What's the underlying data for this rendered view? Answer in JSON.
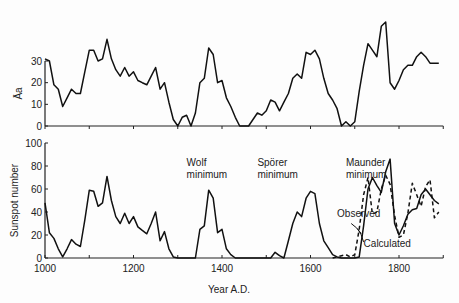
{
  "chart_data": [
    {
      "type": "line",
      "panel": "top",
      "ylabel": "Āa",
      "xlabel": "",
      "ylim": [
        0,
        40
      ],
      "yticks": [
        0,
        10,
        20,
        30
      ],
      "xlim": [
        1000,
        1900
      ],
      "grid": false,
      "series": [
        {
          "name": "Aa",
          "style": "solid",
          "x": [
            1000,
            1010,
            1020,
            1030,
            1040,
            1050,
            1060,
            1070,
            1080,
            1090,
            1100,
            1110,
            1120,
            1130,
            1140,
            1150,
            1160,
            1170,
            1180,
            1190,
            1200,
            1210,
            1220,
            1230,
            1240,
            1250,
            1260,
            1270,
            1280,
            1290,
            1300,
            1310,
            1320,
            1330,
            1340,
            1350,
            1360,
            1370,
            1380,
            1390,
            1400,
            1410,
            1420,
            1430,
            1440,
            1450,
            1460,
            1470,
            1480,
            1490,
            1500,
            1510,
            1520,
            1530,
            1540,
            1550,
            1560,
            1570,
            1580,
            1590,
            1600,
            1610,
            1620,
            1630,
            1640,
            1650,
            1660,
            1670,
            1680,
            1690,
            1700,
            1710,
            1720,
            1730,
            1740,
            1750,
            1760,
            1770,
            1780,
            1790,
            1800,
            1810,
            1820,
            1830,
            1840,
            1850,
            1860,
            1870,
            1880,
            1890
          ],
          "values": [
            31,
            30,
            19,
            17,
            9,
            13,
            17,
            15,
            15,
            25,
            35,
            35,
            30,
            31,
            40,
            31,
            26,
            23,
            27,
            23,
            25,
            21,
            20,
            19,
            23,
            27,
            17,
            20,
            11,
            3,
            0,
            4,
            5,
            0,
            6,
            20,
            22,
            36,
            33,
            20,
            21,
            13,
            9,
            4,
            0,
            0,
            0,
            3,
            6,
            5,
            7,
            12,
            11,
            7,
            11,
            15,
            22,
            24,
            22,
            34,
            33,
            35,
            31,
            22,
            15,
            12,
            8,
            0,
            2,
            0,
            2,
            16,
            28,
            38,
            35,
            32,
            46,
            48,
            20,
            17,
            21,
            26,
            28,
            28,
            32,
            34,
            32,
            29,
            29,
            29
          ]
        }
      ]
    },
    {
      "type": "line",
      "panel": "bottom",
      "ylabel": "Sunspot number",
      "xlabel": "Year A.D.",
      "ylim": [
        0,
        100
      ],
      "yticks": [
        0,
        20,
        40,
        60,
        80,
        100
      ],
      "xlim": [
        1000,
        1900
      ],
      "xticks": [
        1000,
        1200,
        1400,
        1600,
        1800
      ],
      "grid": false,
      "annotations": [
        {
          "text": "Wolf minimum",
          "x": 1320,
          "y": 80
        },
        {
          "text": "Spörer minimum",
          "x": 1480,
          "y": 80
        },
        {
          "text": "Maunder minimum",
          "x": 1680,
          "y": 80
        },
        {
          "text": "Observed",
          "x": 1660,
          "y": 36
        },
        {
          "text": "Calculated",
          "x": 1720,
          "y": 10
        }
      ],
      "series": [
        {
          "name": "Calculated",
          "style": "solid",
          "x": [
            1000,
            1010,
            1020,
            1030,
            1040,
            1050,
            1060,
            1070,
            1080,
            1090,
            1100,
            1110,
            1120,
            1130,
            1140,
            1150,
            1160,
            1170,
            1180,
            1190,
            1200,
            1210,
            1220,
            1230,
            1240,
            1250,
            1260,
            1270,
            1280,
            1290,
            1300,
            1310,
            1320,
            1330,
            1340,
            1350,
            1360,
            1370,
            1380,
            1390,
            1400,
            1410,
            1420,
            1430,
            1440,
            1450,
            1460,
            1470,
            1480,
            1490,
            1500,
            1510,
            1520,
            1530,
            1540,
            1550,
            1560,
            1570,
            1580,
            1590,
            1600,
            1610,
            1620,
            1630,
            1640,
            1650,
            1660,
            1670,
            1680,
            1690,
            1700,
            1710,
            1720,
            1730,
            1740,
            1750,
            1760,
            1770,
            1780,
            1790,
            1800,
            1810,
            1820,
            1830,
            1840,
            1850,
            1860,
            1870,
            1880,
            1890
          ],
          "values": [
            48,
            22,
            17,
            8,
            1,
            8,
            16,
            12,
            10,
            33,
            59,
            58,
            45,
            48,
            71,
            50,
            36,
            30,
            39,
            30,
            36,
            27,
            24,
            21,
            30,
            40,
            15,
            23,
            8,
            1,
            0,
            0,
            0,
            0,
            0,
            25,
            28,
            59,
            52,
            22,
            25,
            8,
            3,
            0,
            0,
            0,
            0,
            0,
            0,
            0,
            0,
            0,
            5,
            2,
            0,
            15,
            30,
            40,
            36,
            52,
            58,
            56,
            30,
            15,
            9,
            3,
            1,
            0,
            0,
            0,
            0,
            1,
            28,
            60,
            70,
            63,
            57,
            75,
            86,
            30,
            20,
            28,
            38,
            42,
            43,
            55,
            60,
            55,
            50,
            47
          ]
        },
        {
          "name": "Observed",
          "style": "dashed",
          "x": [
            1650,
            1660,
            1670,
            1680,
            1690,
            1700,
            1710,
            1720,
            1730,
            1740,
            1750,
            1760,
            1770,
            1780,
            1790,
            1800,
            1810,
            1820,
            1830,
            1840,
            1850,
            1860,
            1870,
            1880,
            1890
          ],
          "values": [
            0,
            1,
            2,
            3,
            1,
            3,
            25,
            55,
            70,
            38,
            40,
            60,
            72,
            64,
            37,
            18,
            20,
            39,
            65,
            55,
            45,
            62,
            68,
            35,
            40
          ]
        }
      ]
    }
  ],
  "panels": {
    "top": {
      "ylabel": "Āa"
    },
    "bottom": {
      "ylabel": "Sunspot number",
      "xlabel": "Year A.D."
    }
  }
}
